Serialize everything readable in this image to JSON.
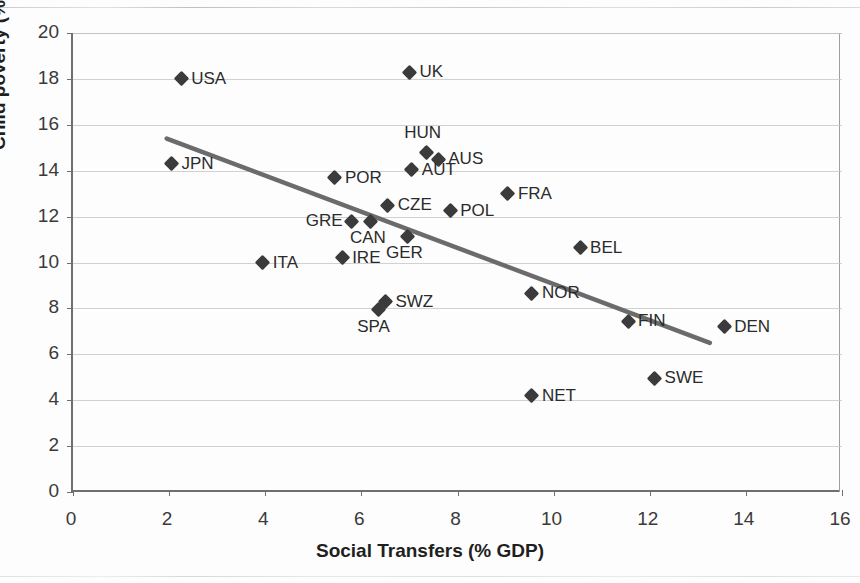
{
  "chart": {
    "type": "scatter",
    "title": "",
    "xlabel": "Social Transfers (% GDP)",
    "ylabel": "Child poverty (%)",
    "xlim": [
      0,
      16
    ],
    "ylim": [
      0,
      20
    ],
    "xticks": [
      "0",
      "2",
      "4",
      "6",
      "8",
      "10",
      "12",
      "14",
      "16"
    ],
    "yticks": [
      "0",
      "2",
      "4",
      "6",
      "8",
      "10",
      "12",
      "14",
      "16",
      "18",
      "20"
    ],
    "grid": "horizontal",
    "legend": "none",
    "marker_color": "#3b3b3b",
    "trendline_color": "#6b6b6b"
  },
  "chart_data": {
    "type": "scatter",
    "title": "",
    "xlabel": "Social Transfers (% GDP)",
    "ylabel": "Child poverty (%)",
    "xlim": [
      0,
      16
    ],
    "ylim": [
      0,
      20
    ],
    "xticks": [
      0,
      2,
      4,
      6,
      8,
      10,
      12,
      14,
      16
    ],
    "yticks": [
      0,
      2,
      4,
      6,
      8,
      10,
      12,
      14,
      16,
      18,
      20
    ],
    "grid": "horizontal gridlines only",
    "legend": "none",
    "series": [
      {
        "name": "Countries",
        "points": [
          {
            "label": "USA",
            "x": 2.25,
            "y": 18.0,
            "label_pos": "right"
          },
          {
            "label": "UK",
            "x": 7.0,
            "y": 18.3,
            "label_pos": "right"
          },
          {
            "label": "JPN",
            "x": 2.05,
            "y": 14.3,
            "label_pos": "right"
          },
          {
            "label": "HUN",
            "x": 7.35,
            "y": 14.8,
            "label_pos": "above"
          },
          {
            "label": "AUS",
            "x": 7.6,
            "y": 14.5,
            "label_pos": "right"
          },
          {
            "label": "AUT",
            "x": 7.05,
            "y": 14.05,
            "label_pos": "right"
          },
          {
            "label": "POR",
            "x": 5.45,
            "y": 13.7,
            "label_pos": "right"
          },
          {
            "label": "FRA",
            "x": 9.05,
            "y": 13.0,
            "label_pos": "right"
          },
          {
            "label": "CZE",
            "x": 6.55,
            "y": 12.5,
            "label_pos": "right"
          },
          {
            "label": "POL",
            "x": 7.85,
            "y": 12.25,
            "label_pos": "right"
          },
          {
            "label": "GRE",
            "x": 5.8,
            "y": 11.8,
            "label_pos": "left"
          },
          {
            "label": "CAN",
            "x": 6.2,
            "y": 11.8,
            "label_pos": "below"
          },
          {
            "label": "GER",
            "x": 6.95,
            "y": 11.15,
            "label_pos": "below"
          },
          {
            "label": "BEL",
            "x": 10.55,
            "y": 10.65,
            "label_pos": "right"
          },
          {
            "label": "IRE",
            "x": 5.6,
            "y": 10.2,
            "label_pos": "right"
          },
          {
            "label": "ITA",
            "x": 3.95,
            "y": 10.0,
            "label_pos": "right"
          },
          {
            "label": "NOR",
            "x": 9.55,
            "y": 8.65,
            "label_pos": "right"
          },
          {
            "label": "SWZ",
            "x": 6.5,
            "y": 8.3,
            "label_pos": "right"
          },
          {
            "label": "SPA",
            "x": 6.35,
            "y": 7.95,
            "label_pos": "below"
          },
          {
            "label": "FIN",
            "x": 11.55,
            "y": 7.45,
            "label_pos": "right"
          },
          {
            "label": "DEN",
            "x": 13.55,
            "y": 7.2,
            "label_pos": "right"
          },
          {
            "label": "SWE",
            "x": 12.1,
            "y": 4.95,
            "label_pos": "right"
          },
          {
            "label": "NET",
            "x": 9.55,
            "y": 4.2,
            "label_pos": "right"
          }
        ]
      }
    ],
    "trendline": {
      "type": "linear",
      "x0": 1.95,
      "y0": 15.4,
      "x1": 13.25,
      "y1": 6.5
    }
  }
}
